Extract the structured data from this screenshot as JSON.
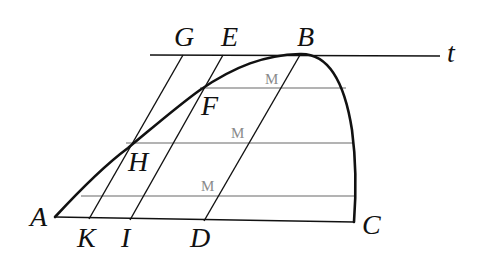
{
  "figure": {
    "type": "geometric construction",
    "colors": {
      "ink": "#111111",
      "chord": "#9a9a9a",
      "m_label": "#8a8a8a",
      "background": "#ffffff"
    },
    "points": {
      "A": "A",
      "B": "B",
      "C": "C",
      "D": "D",
      "E": "E",
      "F": "F",
      "G": "G",
      "H": "H",
      "I": "I",
      "K": "K",
      "t": "t"
    },
    "midpoint_labels": [
      "M",
      "M",
      "M"
    ],
    "lines": {
      "tangent": "line through B labelled t",
      "base": "AC",
      "parallels": [
        "GK",
        "EI",
        "BD"
      ],
      "chords": 3
    }
  }
}
